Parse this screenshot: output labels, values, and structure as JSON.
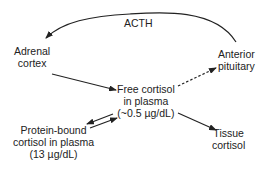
{
  "diagram": {
    "acth_label": "ACTH",
    "nodes": {
      "adrenal_cortex": {
        "line1": "Adrenal",
        "line2": "cortex"
      },
      "anterior_pituitary": {
        "line1": "Anterior",
        "line2": "pituitary"
      },
      "free_cortisol": {
        "line1": "Free cortisol",
        "line2": "in plasma",
        "line3": "(~0.5 µg/dL)"
      },
      "protein_bound": {
        "line1": "Protein-bound",
        "line2": "cortisol in plasma",
        "line3": "(13 µg/dL)"
      },
      "tissue_cortisol": {
        "line1": "Tissue",
        "line2": "cortisol"
      }
    },
    "edges": [
      {
        "from": "anterior_pituitary",
        "to": "adrenal_cortex",
        "label": "ACTH",
        "style": "solid-curve"
      },
      {
        "from": "adrenal_cortex",
        "to": "free_cortisol",
        "style": "solid"
      },
      {
        "from": "free_cortisol",
        "to": "anterior_pituitary",
        "style": "dashed"
      },
      {
        "from": "free_cortisol",
        "to": "protein_bound",
        "style": "solid"
      },
      {
        "from": "protein_bound",
        "to": "free_cortisol",
        "style": "solid"
      },
      {
        "from": "free_cortisol",
        "to": "tissue_cortisol",
        "style": "solid"
      }
    ],
    "colors": {
      "line": "#222222",
      "background": "#ffffff"
    }
  }
}
